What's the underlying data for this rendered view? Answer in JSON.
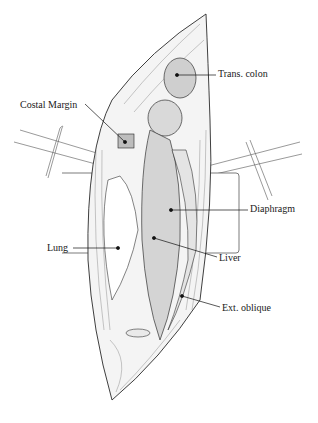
{
  "figure": {
    "type": "anatomical-illustration",
    "labels": [
      {
        "id": "trans-colon",
        "text": "Trans. colon",
        "x": 218,
        "y": 67
      },
      {
        "id": "costal-margin",
        "text": "Costal Margin",
        "x": 20,
        "y": 99
      },
      {
        "id": "diaphragm",
        "text": "Diaphragm",
        "x": 250,
        "y": 203
      },
      {
        "id": "lung",
        "text": "Lung",
        "x": 47,
        "y": 243
      },
      {
        "id": "liver",
        "text": "Liver",
        "x": 219,
        "y": 253
      },
      {
        "id": "ext-oblique",
        "text": "Ext. oblique",
        "x": 222,
        "y": 303
      }
    ],
    "colors": {
      "ink": "#2a2a2a",
      "shade": "#d8d8d8",
      "paper": "#ffffff"
    }
  }
}
